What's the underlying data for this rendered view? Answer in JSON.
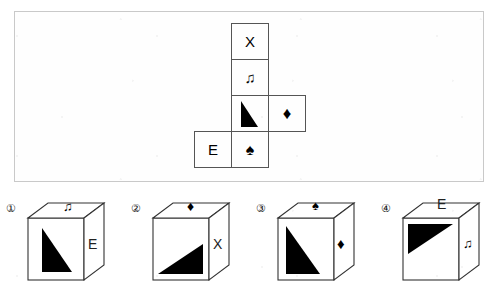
{
  "puzzle": {
    "type": "cube-folding",
    "net_panel": {
      "label": "unfolded-cube-net",
      "cells": [
        {
          "id": "net-cell-x",
          "symbol": "X",
          "symbol_kind": "letter",
          "col": 1,
          "row": 0
        },
        {
          "id": "net-cell-note",
          "symbol": "♫",
          "symbol_kind": "music-note",
          "col": 1,
          "row": 1
        },
        {
          "id": "net-cell-triangle",
          "symbol": "triangle",
          "symbol_kind": "triangle",
          "col": 1,
          "row": 2
        },
        {
          "id": "net-cell-diamond",
          "symbol": "♦",
          "symbol_kind": "diamond",
          "col": 2,
          "row": 2
        },
        {
          "id": "net-cell-e",
          "symbol": "E",
          "symbol_kind": "letter",
          "col": 0,
          "row": 3
        },
        {
          "id": "net-cell-spade",
          "symbol": "♠",
          "symbol_kind": "spade",
          "col": 1,
          "row": 3
        }
      ]
    },
    "options": [
      {
        "number": "①",
        "name": "option-1",
        "top_face": {
          "symbol": "♫",
          "kind": "music-note"
        },
        "front_face": {
          "symbol": "triangle",
          "kind": "triangle",
          "orientation": "right-angle-top-left-vertical-left"
        },
        "right_face": {
          "symbol": "E",
          "kind": "letter"
        }
      },
      {
        "number": "②",
        "name": "option-2",
        "top_face": {
          "symbol": "♦",
          "kind": "diamond"
        },
        "front_face": {
          "symbol": "triangle",
          "kind": "triangle",
          "orientation": "right-angle-bottom-right"
        },
        "right_face": {
          "symbol": "X",
          "kind": "letter"
        }
      },
      {
        "number": "③",
        "name": "option-3",
        "top_face": {
          "symbol": "♠",
          "kind": "spade"
        },
        "front_face": {
          "symbol": "triangle",
          "kind": "triangle",
          "orientation": "right-angle-top-left-vertical-left"
        },
        "right_face": {
          "symbol": "♦",
          "kind": "diamond"
        }
      },
      {
        "number": "④",
        "name": "option-4",
        "top_face": {
          "symbol": "E",
          "kind": "letter"
        },
        "front_face": {
          "symbol": "triangle",
          "kind": "triangle",
          "orientation": "right-angle-top-left-horizontal-top"
        },
        "right_face": {
          "symbol": "♫",
          "kind": "music-note"
        }
      }
    ]
  },
  "colors": {
    "ink": "#000000",
    "cell_border": "#555555",
    "panel_border": "#c9c9c9",
    "paper": "#ffffff"
  }
}
